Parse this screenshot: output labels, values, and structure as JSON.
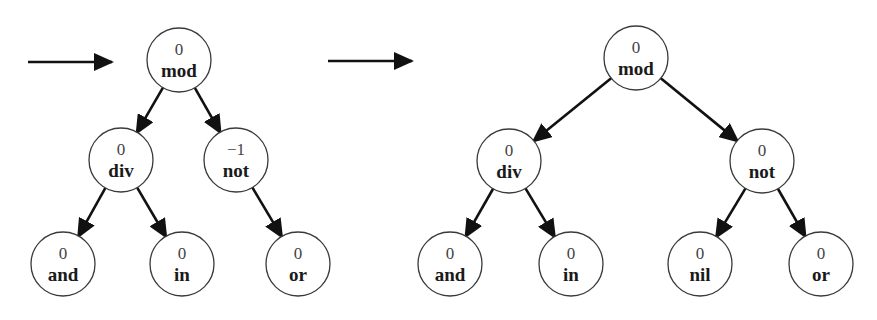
{
  "diagram": {
    "colors": {
      "stroke": "#111111",
      "node_fill": "#ffffff",
      "node_border": "#3a3a3a"
    },
    "trees": [
      {
        "id": "before",
        "entry_arrow": {
          "x1": 28,
          "y1": 62,
          "x2": 112,
          "y2": 62
        },
        "nodes": [
          {
            "id": "mod",
            "label": "mod",
            "value": "0",
            "x": 179,
            "y": 60
          },
          {
            "id": "div",
            "label": "div",
            "value": "0",
            "x": 121,
            "y": 160
          },
          {
            "id": "not",
            "label": "not",
            "value": "−1",
            "x": 236,
            "y": 160
          },
          {
            "id": "and",
            "label": "and",
            "value": "0",
            "x": 63,
            "y": 264
          },
          {
            "id": "in",
            "label": "in",
            "value": "0",
            "x": 182,
            "y": 264
          },
          {
            "id": "or",
            "label": "or",
            "value": "0",
            "x": 298,
            "y": 264
          }
        ],
        "edges": [
          [
            "mod",
            "div"
          ],
          [
            "mod",
            "not"
          ],
          [
            "div",
            "and"
          ],
          [
            "div",
            "in"
          ],
          [
            "not",
            "or"
          ]
        ]
      },
      {
        "id": "after",
        "entry_arrow": {
          "x1": 328,
          "y1": 61,
          "x2": 412,
          "y2": 61
        },
        "nodes": [
          {
            "id": "mod",
            "label": "mod",
            "value": "0",
            "x": 636,
            "y": 58
          },
          {
            "id": "div",
            "label": "div",
            "value": "0",
            "x": 509,
            "y": 161
          },
          {
            "id": "not",
            "label": "not",
            "value": "0",
            "x": 762,
            "y": 161
          },
          {
            "id": "and",
            "label": "and",
            "value": "0",
            "x": 450,
            "y": 264
          },
          {
            "id": "in",
            "label": "in",
            "value": "0",
            "x": 571,
            "y": 264
          },
          {
            "id": "nil",
            "label": "nil",
            "value": "0",
            "x": 700,
            "y": 264
          },
          {
            "id": "or",
            "label": "or",
            "value": "0",
            "x": 821,
            "y": 264
          }
        ],
        "edges": [
          [
            "mod",
            "div"
          ],
          [
            "mod",
            "not"
          ],
          [
            "div",
            "and"
          ],
          [
            "div",
            "in"
          ],
          [
            "not",
            "nil"
          ],
          [
            "not",
            "or"
          ]
        ]
      }
    ]
  }
}
